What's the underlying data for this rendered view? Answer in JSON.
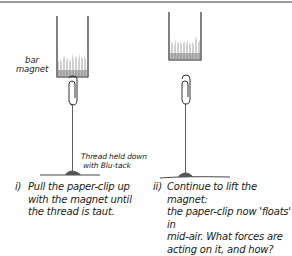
{
  "figure": {
    "labels": {
      "magnet": [
        "bar",
        "magnet"
      ],
      "thread": [
        "Thread held down",
        "with Blu-tack"
      ]
    },
    "panels": [
      {
        "id": "i",
        "number": "i)",
        "caption_lines": [
          "Pull the paper-clip up",
          "with the magnet until",
          "the thread is taut."
        ]
      },
      {
        "id": "ii",
        "number": "ii)",
        "caption_lines": [
          "Continue to lift the magnet:",
          "the paper-clip now 'floats' in",
          "mid-air. What forces are",
          "acting on it, and how?"
        ]
      }
    ],
    "colors": {
      "ink": "#1a1a1a",
      "shading": "#8a8a8a",
      "border": "#9a9a9a"
    }
  }
}
